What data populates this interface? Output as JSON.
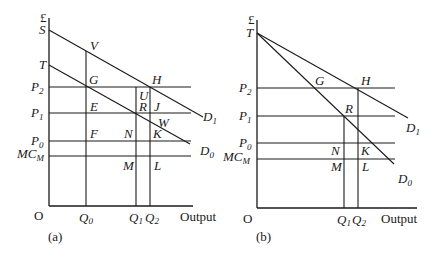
{
  "panel_a": {
    "caption": "(a)",
    "y_axis_unit": "£",
    "origin": "O",
    "x_axis_label": "Output",
    "intercepts": {
      "S": "S",
      "T": "T"
    },
    "price_levels": [
      {
        "base": "P",
        "sub": "2"
      },
      {
        "base": "P",
        "sub": "1"
      },
      {
        "base": "P",
        "sub": "0"
      },
      {
        "base": "MC",
        "sub": "M"
      }
    ],
    "quantities": [
      {
        "base": "Q",
        "sub": "0"
      },
      {
        "base": "Q",
        "sub": "1"
      },
      {
        "base": "Q",
        "sub": "2"
      }
    ],
    "curves": [
      {
        "base": "D",
        "sub": "1"
      },
      {
        "base": "D",
        "sub": "0"
      }
    ],
    "points": {
      "V": "V",
      "G": "G",
      "H": "H",
      "U": "U",
      "E": "E",
      "R": "R",
      "J": "J",
      "W": "W",
      "F": "F",
      "N": "N",
      "K": "K",
      "M": "M",
      "L": "L"
    }
  },
  "panel_b": {
    "caption": "(b)",
    "y_axis_unit": "£",
    "origin": "O",
    "x_axis_label": "Output",
    "intercepts": {
      "T": "T"
    },
    "price_levels": [
      {
        "base": "P",
        "sub": "2"
      },
      {
        "base": "P",
        "sub": "1"
      },
      {
        "base": "P",
        "sub": "0"
      },
      {
        "base": "MC",
        "sub": "M"
      }
    ],
    "quantities": [
      {
        "base": "Q",
        "sub": "1"
      },
      {
        "base": "Q",
        "sub": "2"
      }
    ],
    "curves": [
      {
        "base": "D",
        "sub": "1"
      },
      {
        "base": "D",
        "sub": "0"
      }
    ],
    "points": {
      "G": "G",
      "H": "H",
      "R": "R",
      "N": "N",
      "K": "K",
      "M": "M",
      "L": "L"
    }
  }
}
